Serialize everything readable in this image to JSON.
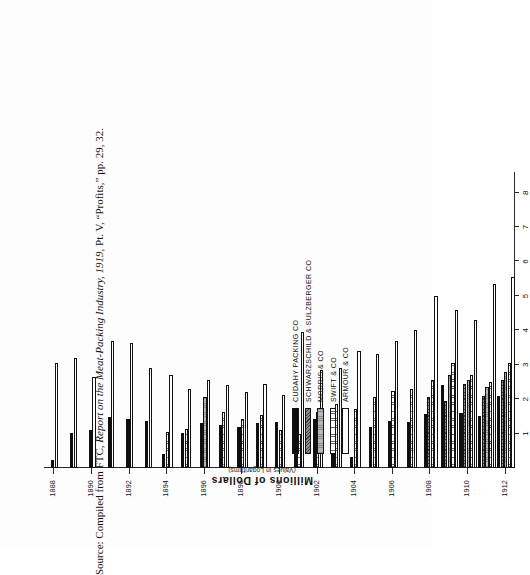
{
  "figure": {
    "axis_title": "Millions of Dollars",
    "axis_subtitle": "(Values in Logarithms)",
    "source": "Source: Compiled from FTC, ",
    "source_italic": "Report on the Meat-Packing Industry, 1919",
    "source_tail": ", Pt. V, “Profits,” pp. 29, 32."
  },
  "legend": {
    "items": [
      {
        "label": "CUDAHY  PACKING  CO",
        "pattern": "p-cudahy",
        "color": "#0d0d0d"
      },
      {
        "label": "SCHWARZSCHILD  &  SULZBERGER  CO",
        "pattern": "p-schwarz",
        "color": "#8e8e8e"
      },
      {
        "label": "MORRIS  &  CO",
        "pattern": "p-morris",
        "color": "#b9b9b9"
      },
      {
        "label": "SWIFT  &  CO",
        "pattern": "p-swift",
        "color": "#d9d9d9"
      },
      {
        "label": "ARMOUR  &  CO",
        "pattern": "p-armour",
        "color": "#ffffff"
      }
    ]
  },
  "chart_data": {
    "type": "bar",
    "orientation": "horizontal",
    "title": "",
    "xlabel": "Millions of Dollars (Values in Logarithms)",
    "ylabel": "",
    "scale": "log",
    "xlim": [
      0,
      8.6
    ],
    "grid": false,
    "legend_position": "left-inside",
    "xticks": [
      8,
      7,
      6,
      5,
      4,
      3,
      2,
      1
    ],
    "xticklabels": [
      "8",
      "7",
      "6",
      "5",
      "4",
      "3",
      "2",
      "1"
    ],
    "categories": [
      1888,
      1889,
      1890,
      1891,
      1892,
      1893,
      1894,
      1895,
      1896,
      1897,
      1898,
      1899,
      1900,
      1901,
      1902,
      1903,
      1904,
      1905,
      1906,
      1907,
      1908,
      1909,
      1910,
      1911,
      1912
    ],
    "ticklabel_years": [
      1888,
      1890,
      1892,
      1894,
      1896,
      1898,
      1900,
      1902,
      1904,
      1906,
      1908,
      1910,
      1912
    ],
    "series": [
      {
        "name": "CUDAHY  PACKING  CO",
        "pattern": "p-cudahy",
        "values": [
          null,
          null,
          null,
          null,
          null,
          null,
          null,
          null,
          null,
          null,
          null,
          null,
          null,
          null,
          null,
          null,
          null,
          null,
          null,
          null,
          null,
          null,
          null,
          null,
          null
        ]
      },
      {
        "name": "SCHWARZSCHILD  &  SULZBERGER  CO",
        "pattern": "p-schwarz",
        "values": [
          null,
          null,
          null,
          null,
          null,
          null,
          null,
          null,
          null,
          null,
          null,
          null,
          null,
          null,
          null,
          null,
          null,
          null,
          null,
          null,
          null,
          null,
          null,
          null,
          null
        ]
      },
      {
        "name": "MORRIS  &  CO",
        "pattern": "p-morris",
        "values": [
          null,
          null,
          null,
          null,
          null,
          null,
          null,
          null,
          null,
          null,
          null,
          null,
          null,
          null,
          null,
          null,
          null,
          null,
          null,
          null,
          null,
          null,
          null,
          null,
          null
        ]
      },
      {
        "name": "SWIFT  &  CO",
        "pattern": "p-swift",
        "values": [
          null,
          null,
          null,
          null,
          null,
          null,
          null,
          null,
          null,
          null,
          null,
          null,
          null,
          null,
          null,
          null,
          null,
          null,
          null,
          null,
          null,
          null,
          null,
          null,
          null
        ]
      },
      {
        "name": "ARMOUR  &  CO",
        "pattern": "p-armour",
        "values": [
          null,
          null,
          null,
          null,
          null,
          null,
          null,
          null,
          null,
          null,
          null,
          null,
          null,
          null,
          null,
          null,
          null,
          null,
          null,
          null,
          null,
          null,
          null,
          null,
          null
        ]
      }
    ],
    "groups": [
      {
        "year": 1888,
        "bars": [
          {
            "s": "p-cudahy",
            "v": 0.22
          },
          {
            "s": "p-armour",
            "v": 3.05
          }
        ]
      },
      {
        "year": 1889,
        "bars": [
          {
            "s": "p-cudahy",
            "v": 1.02
          },
          {
            "s": "p-armour",
            "v": 3.2
          }
        ]
      },
      {
        "year": 1890,
        "bars": [
          {
            "s": "p-cudahy",
            "v": 1.1
          },
          {
            "s": "p-armour",
            "v": 2.65
          }
        ]
      },
      {
        "year": 1891,
        "bars": [
          {
            "s": "p-cudahy",
            "v": 1.48
          },
          {
            "s": "p-armour",
            "v": 3.7
          }
        ]
      },
      {
        "year": 1892,
        "bars": [
          {
            "s": "p-cudahy",
            "v": 1.42
          },
          {
            "s": "p-armour",
            "v": 3.62
          }
        ]
      },
      {
        "year": 1893,
        "bars": [
          {
            "s": "p-cudahy",
            "v": 1.38
          },
          {
            "s": "p-armour",
            "v": 2.9
          }
        ]
      },
      {
        "year": 1894,
        "bars": [
          {
            "s": "p-cudahy",
            "v": 0.4
          },
          {
            "s": "p-swift",
            "v": 1.05
          },
          {
            "s": "p-armour",
            "v": 2.7
          }
        ]
      },
      {
        "year": 1895,
        "bars": [
          {
            "s": "p-cudahy",
            "v": 1.02
          },
          {
            "s": "p-swift",
            "v": 1.12
          },
          {
            "s": "p-armour",
            "v": 2.3
          }
        ]
      },
      {
        "year": 1896,
        "bars": [
          {
            "s": "p-cudahy",
            "v": 1.3
          },
          {
            "s": "p-morris",
            "v": 2.05
          },
          {
            "s": "p-armour",
            "v": 2.55
          }
        ]
      },
      {
        "year": 1897,
        "bars": [
          {
            "s": "p-cudahy",
            "v": 1.25
          },
          {
            "s": "p-swift",
            "v": 1.62
          },
          {
            "s": "p-armour",
            "v": 2.4
          }
        ]
      },
      {
        "year": 1898,
        "bars": [
          {
            "s": "p-cudahy",
            "v": 1.18
          },
          {
            "s": "p-swift",
            "v": 1.42
          },
          {
            "s": "p-armour",
            "v": 2.2
          }
        ]
      },
      {
        "year": 1899,
        "bars": [
          {
            "s": "p-cudahy",
            "v": 1.3
          },
          {
            "s": "p-swift",
            "v": 1.55
          },
          {
            "s": "p-armour",
            "v": 2.45
          }
        ]
      },
      {
        "year": 1900,
        "bars": [
          {
            "s": "p-cudahy",
            "v": 1.35
          },
          {
            "s": "p-swift",
            "v": 1.1
          },
          {
            "s": "p-armour",
            "v": 2.12
          }
        ]
      },
      {
        "year": 1901,
        "bars": [
          {
            "s": "p-cudahy",
            "v": 1.05
          },
          {
            "s": "p-swift",
            "v": 1.0
          },
          {
            "s": "p-armour",
            "v": 3.95
          }
        ]
      },
      {
        "year": 1902,
        "bars": [
          {
            "s": "p-cudahy",
            "v": 1.42
          },
          {
            "s": "p-swift",
            "v": 1.62
          },
          {
            "s": "p-armour",
            "v": 2.85
          }
        ]
      },
      {
        "year": 1903,
        "bars": [
          {
            "s": "p-cudahy",
            "v": 1.55
          },
          {
            "s": "p-swift",
            "v": 1.85
          },
          {
            "s": "p-armour",
            "v": 2.9
          }
        ]
      },
      {
        "year": 1904,
        "bars": [
          {
            "s": "p-cudahy",
            "v": 0.32
          },
          {
            "s": "p-swift",
            "v": 1.7
          },
          {
            "s": "p-armour",
            "v": 3.4
          }
        ]
      },
      {
        "year": 1905,
        "bars": [
          {
            "s": "p-cudahy",
            "v": 1.2
          },
          {
            "s": "p-swift",
            "v": 2.05
          },
          {
            "s": "p-armour",
            "v": 3.3
          }
        ]
      },
      {
        "year": 1906,
        "bars": [
          {
            "s": "p-cudahy",
            "v": 1.38
          },
          {
            "s": "p-swift",
            "v": 2.25
          },
          {
            "s": "p-armour",
            "v": 3.7
          }
        ]
      },
      {
        "year": 1907,
        "bars": [
          {
            "s": "p-cudahy",
            "v": 1.35
          },
          {
            "s": "p-swift",
            "v": 2.3
          },
          {
            "s": "p-armour",
            "v": 4.0
          }
        ]
      },
      {
        "year": 1908,
        "bars": [
          {
            "s": "p-cudahy",
            "v": 1.58
          },
          {
            "s": "p-schwarz",
            "v": 2.05
          },
          {
            "s": "p-swift",
            "v": 2.55
          },
          {
            "s": "p-armour",
            "v": 5.0
          }
        ]
      },
      {
        "year": 1909,
        "bars": [
          {
            "s": "p-cudahy",
            "v": 2.4
          },
          {
            "s": "p-schwarz",
            "v": 1.95
          },
          {
            "s": "p-morris",
            "v": 2.7
          },
          {
            "s": "p-swift",
            "v": 3.05
          },
          {
            "s": "p-armour",
            "v": 4.6
          }
        ]
      },
      {
        "year": 1910,
        "bars": [
          {
            "s": "p-cudahy",
            "v": 1.6
          },
          {
            "s": "p-schwarz",
            "v": 2.45
          },
          {
            "s": "p-morris",
            "v": 2.55
          },
          {
            "s": "p-swift",
            "v": 2.7
          },
          {
            "s": "p-armour",
            "v": 4.3
          }
        ]
      },
      {
        "year": 1911,
        "bars": [
          {
            "s": "p-cudahy",
            "v": 1.5
          },
          {
            "s": "p-schwarz",
            "v": 2.1
          },
          {
            "s": "p-morris",
            "v": 2.35
          },
          {
            "s": "p-swift",
            "v": 2.5
          },
          {
            "s": "p-armour",
            "v": 5.35
          }
        ]
      },
      {
        "year": 1912,
        "bars": [
          {
            "s": "p-cudahy",
            "v": 2.1
          },
          {
            "s": "p-schwarz",
            "v": 2.55
          },
          {
            "s": "p-morris",
            "v": 2.8
          },
          {
            "s": "p-swift",
            "v": 3.05
          },
          {
            "s": "p-armour",
            "v": 5.55
          }
        ]
      }
    ]
  }
}
